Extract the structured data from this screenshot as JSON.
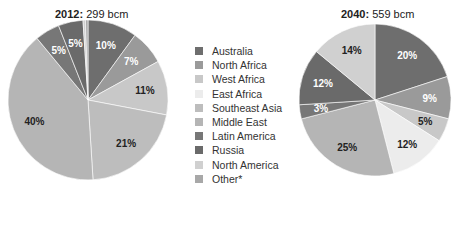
{
  "chart_data": [
    {
      "type": "pie",
      "title_bold": "2012:",
      "title_rest": " 299 bcm",
      "total": "299 bcm",
      "categories": [
        "Australia",
        "North Africa",
        "West Africa",
        "East Africa",
        "Southeast Asia",
        "Middle East",
        "Latin America",
        "Russia",
        "North America",
        "Other*"
      ],
      "values": [
        10,
        7,
        11,
        0,
        21,
        40,
        5,
        5,
        0.5,
        0.5
      ],
      "labels": [
        "10%",
        "7%",
        "11%",
        "",
        "21%",
        "40%",
        "5%",
        "5%",
        "",
        ""
      ]
    },
    {
      "type": "pie",
      "title_bold": "2040:",
      "title_rest": " 559 bcm",
      "total": "559 bcm",
      "categories": [
        "Australia",
        "North Africa",
        "West Africa",
        "East Africa",
        "Southeast Asia",
        "Middle East",
        "Latin America",
        "Russia",
        "North America",
        "Other*"
      ],
      "values": [
        20,
        9,
        5,
        12,
        0,
        25,
        3,
        12,
        14,
        0
      ],
      "labels": [
        "20%",
        "9%",
        "5%",
        "12%",
        "",
        "25%",
        "3%",
        "12%",
        "14%",
        ""
      ]
    }
  ],
  "legend": {
    "position": "center",
    "items": [
      {
        "label": "Australia",
        "color": "#6e6e6e"
      },
      {
        "label": "North Africa",
        "color": "#9a9a9a"
      },
      {
        "label": "West Africa",
        "color": "#c8c8c8"
      },
      {
        "label": "East Africa",
        "color": "#ececec"
      },
      {
        "label": "Southeast Asia",
        "color": "#bdbdbd"
      },
      {
        "label": "Middle East",
        "color": "#b5b5b5"
      },
      {
        "label": "Latin America",
        "color": "#777777"
      },
      {
        "label": "Russia",
        "color": "#6a6a6a"
      },
      {
        "label": "North America",
        "color": "#d0d0d0"
      },
      {
        "label": "Other*",
        "color": "#a8a8a8"
      }
    ]
  },
  "label_colors": {
    "dark_slice_text": "#ffffff",
    "light_slice_text": "#222222"
  }
}
